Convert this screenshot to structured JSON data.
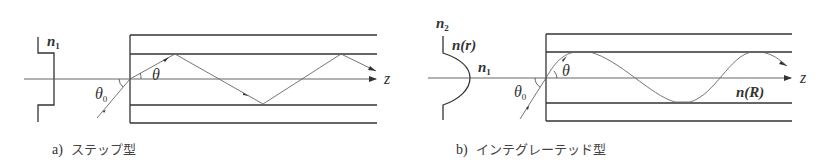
{
  "panels": [
    {
      "id": "a",
      "caption_letter": "a)",
      "caption_text": "ステップ型",
      "profile_label": "n",
      "profile_label_sub": "1",
      "incident_angle_label": "θ",
      "incident_angle_sub": "0",
      "ray_angle_label": "θ",
      "axis_label": "z",
      "profile_type": "step"
    },
    {
      "id": "b",
      "caption_letter": "b)",
      "caption_text": "インテグレーテッド型",
      "outer_label": "n",
      "outer_label_sub": "2",
      "profile_label": "n(r)",
      "core_label": "n",
      "core_label_sub": "1",
      "incident_angle_label": "θ",
      "incident_angle_sub": "0",
      "ray_angle_label": "θ",
      "axis_label": "z",
      "fiber_label": "n(R)",
      "profile_type": "graded"
    }
  ]
}
